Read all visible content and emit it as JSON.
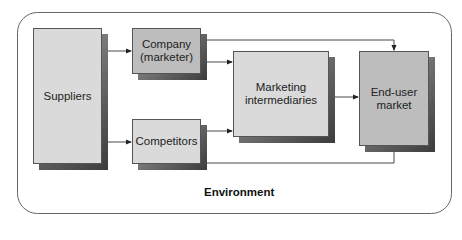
{
  "diagram": {
    "frame_label": "Environment",
    "nodes": [
      {
        "id": "suppliers",
        "label": "Suppliers"
      },
      {
        "id": "company",
        "label": "Company (marketer)",
        "line1": "Company",
        "line2": "(marketer)"
      },
      {
        "id": "competitors",
        "label": "Competitors"
      },
      {
        "id": "intermediaries",
        "label": "Marketing intermediaries",
        "line1": "Marketing",
        "line2": "intermediaries"
      },
      {
        "id": "end_user",
        "label": "End-user market",
        "line1": "End-user",
        "line2": "market"
      }
    ],
    "edges": [
      {
        "from": "suppliers",
        "to": "company"
      },
      {
        "from": "suppliers",
        "to": "competitors"
      },
      {
        "from": "company",
        "to": "intermediaries"
      },
      {
        "from": "company",
        "to": "end_user"
      },
      {
        "from": "competitors",
        "to": "intermediaries"
      },
      {
        "from": "competitors",
        "to": "end_user"
      },
      {
        "from": "intermediaries",
        "to": "end_user"
      }
    ],
    "colors": {
      "box_light": "#dadada",
      "box_mid": "#bdbdbd",
      "border": "#555555",
      "shadow": "#3c3c3c"
    }
  }
}
